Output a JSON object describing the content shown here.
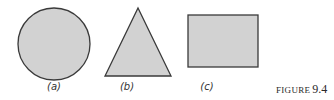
{
  "figure": {
    "caption_word": "FIGURE",
    "caption_number": "9.4",
    "fill_color": "#d2d2d2",
    "stroke_color": "#3a3a3a"
  },
  "panels": [
    {
      "label": "(a)",
      "shape": "circle"
    },
    {
      "label": "(b)",
      "shape": "triangle"
    },
    {
      "label": "(c)",
      "shape": "rectangle"
    }
  ]
}
